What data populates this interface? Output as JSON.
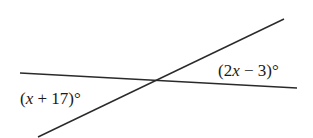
{
  "diagram": {
    "type": "intersecting-lines",
    "line_color": "#2a2a2a",
    "lines": [
      {
        "name": "near-horizontal-line",
        "x1": 20,
        "y1": 73,
        "x2": 297,
        "y2": 88
      },
      {
        "name": "slanted-line",
        "x1": 38,
        "y1": 137,
        "x2": 284,
        "y2": 19
      }
    ],
    "angles": [
      {
        "name": "left-angle",
        "pre": "(",
        "var": "x",
        "post": " + 17)°",
        "text": "(x + 17)°"
      },
      {
        "name": "right-angle",
        "pre": "(2",
        "var": "x",
        "post": " − 3)°",
        "text": "(2x − 3)°"
      }
    ]
  }
}
